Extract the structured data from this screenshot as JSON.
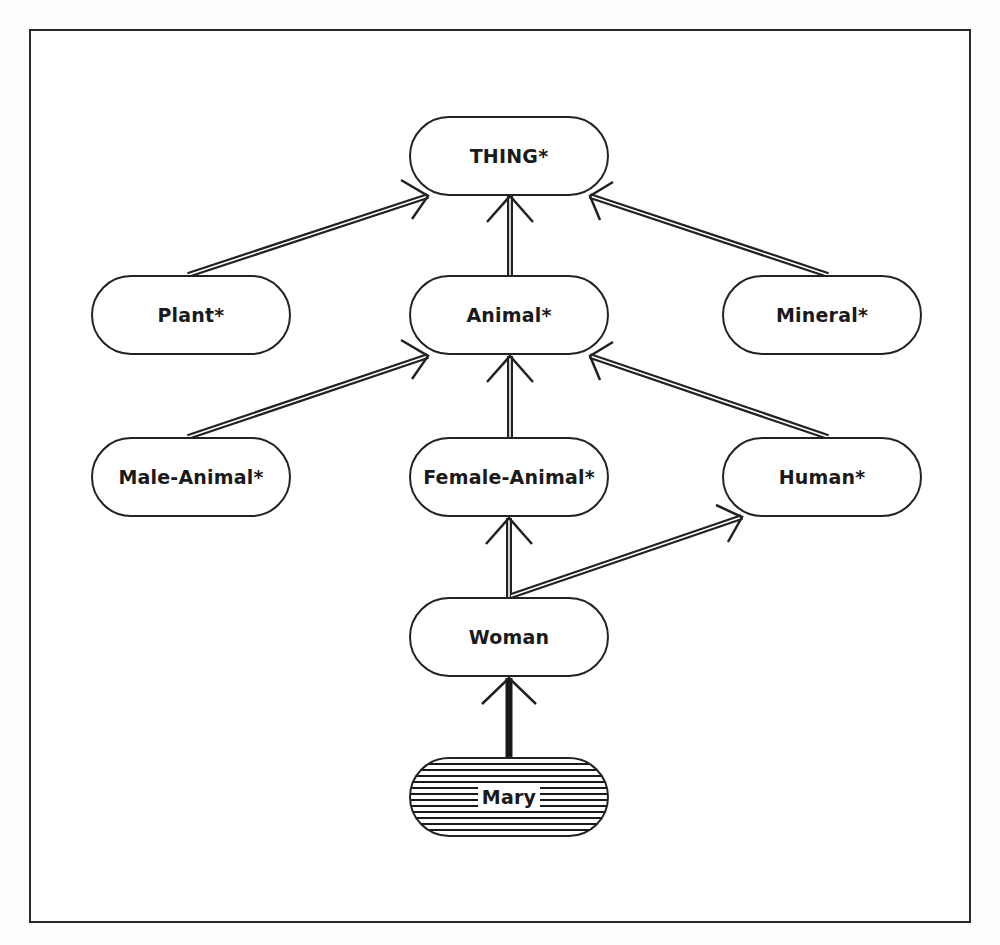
{
  "diagram": {
    "type": "taxonomy-hierarchy",
    "nodes": [
      {
        "id": "thing",
        "label": "THING*"
      },
      {
        "id": "plant",
        "label": "Plant*"
      },
      {
        "id": "animal",
        "label": "Animal*"
      },
      {
        "id": "mineral",
        "label": "Mineral*"
      },
      {
        "id": "male_animal",
        "label": "Male-Animal*"
      },
      {
        "id": "female_animal",
        "label": "Female-Animal*"
      },
      {
        "id": "human",
        "label": "Human*"
      },
      {
        "id": "woman",
        "label": "Woman"
      },
      {
        "id": "mary",
        "label": "Mary",
        "style": "hatched"
      }
    ],
    "edges": [
      {
        "from": "plant",
        "to": "thing",
        "kind": "subclass-double-line"
      },
      {
        "from": "animal",
        "to": "thing",
        "kind": "subclass-double-line"
      },
      {
        "from": "mineral",
        "to": "thing",
        "kind": "subclass-double-line"
      },
      {
        "from": "male_animal",
        "to": "animal",
        "kind": "subclass-double-line"
      },
      {
        "from": "female_animal",
        "to": "animal",
        "kind": "subclass-double-line"
      },
      {
        "from": "human",
        "to": "animal",
        "kind": "subclass-double-line"
      },
      {
        "from": "woman",
        "to": "female_animal",
        "kind": "subclass-double-line"
      },
      {
        "from": "woman",
        "to": "human",
        "kind": "subclass-double-line"
      },
      {
        "from": "mary",
        "to": "woman",
        "kind": "instance-single-line"
      }
    ],
    "colors": {
      "stroke": "#222222",
      "background": "#ffffff"
    }
  }
}
